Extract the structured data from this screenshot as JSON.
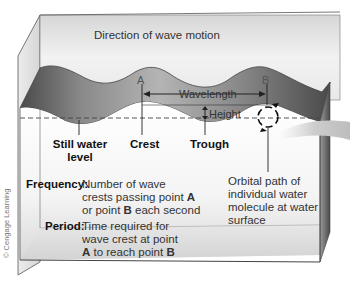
{
  "diagram": {
    "title": "Direction of wave motion",
    "points": {
      "a": "A",
      "b": "B"
    },
    "measures": {
      "wavelength": "Wavelength",
      "height": "Height"
    },
    "parts": {
      "still_water_line1": "Still water",
      "still_water_line2": "level",
      "crest": "Crest",
      "trough": "Trough"
    },
    "orbital": {
      "line1": "Orbital path of",
      "line2": "individual water",
      "line3": "molecule at water",
      "line4": "surface"
    },
    "definitions": {
      "frequency_term": "Frequency:",
      "frequency_line1": "Number of wave",
      "frequency_line2_pre": "crests passing point ",
      "frequency_line2_bold": "A",
      "frequency_line3_pre": "or point ",
      "frequency_line3_bold": "B",
      "frequency_line3_post": " each second",
      "period_term": "Period:",
      "period_line1": "Time required for",
      "period_line2": "wave crest at point",
      "period_line3_bold_a": "A",
      "period_line3_mid": " to reach point ",
      "period_line3_bold_b": "B"
    },
    "credit": "© Cengage Learning",
    "colors": {
      "box_face": "#e4e4e4",
      "wave_dark": "#5e5e5e",
      "wave_mid": "#a8a8a8",
      "line": "#222222",
      "dashed": "#444444"
    }
  }
}
